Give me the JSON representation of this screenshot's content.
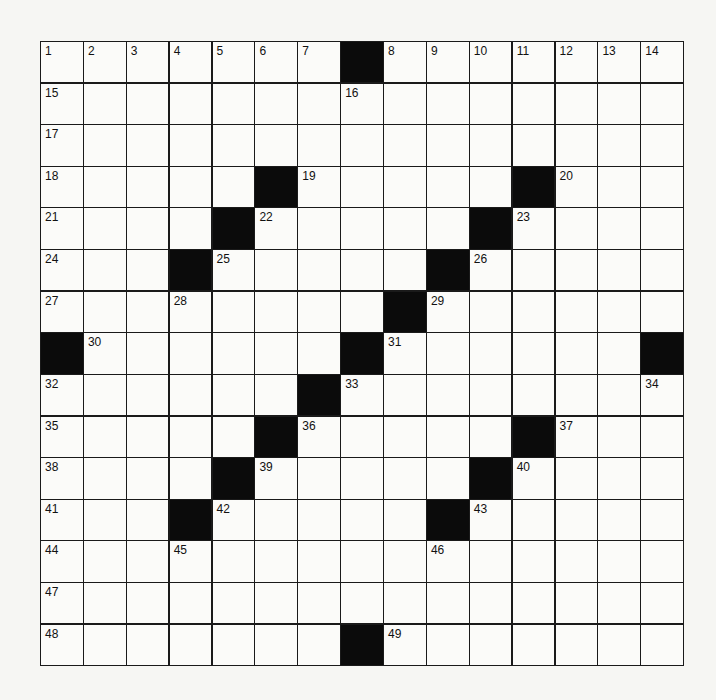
{
  "puzzle": {
    "rows": 15,
    "cols": 15,
    "colors": {
      "block": "#0b0b0b",
      "cell": "#fbfbf9",
      "line": "#1a1a1a"
    },
    "blocks": [
      [
        0,
        7
      ],
      [
        3,
        5
      ],
      [
        3,
        11
      ],
      [
        4,
        4
      ],
      [
        4,
        10
      ],
      [
        5,
        3
      ],
      [
        5,
        9
      ],
      [
        6,
        8
      ],
      [
        7,
        0
      ],
      [
        7,
        7
      ],
      [
        7,
        14
      ],
      [
        8,
        6
      ],
      [
        9,
        5
      ],
      [
        9,
        11
      ],
      [
        10,
        4
      ],
      [
        10,
        10
      ],
      [
        11,
        3
      ],
      [
        11,
        9
      ],
      [
        14,
        7
      ]
    ],
    "numbers": [
      {
        "r": 0,
        "c": 0,
        "n": "1"
      },
      {
        "r": 0,
        "c": 1,
        "n": "2"
      },
      {
        "r": 0,
        "c": 2,
        "n": "3"
      },
      {
        "r": 0,
        "c": 3,
        "n": "4"
      },
      {
        "r": 0,
        "c": 4,
        "n": "5"
      },
      {
        "r": 0,
        "c": 5,
        "n": "6"
      },
      {
        "r": 0,
        "c": 6,
        "n": "7"
      },
      {
        "r": 0,
        "c": 8,
        "n": "8"
      },
      {
        "r": 0,
        "c": 9,
        "n": "9"
      },
      {
        "r": 0,
        "c": 10,
        "n": "10"
      },
      {
        "r": 0,
        "c": 11,
        "n": "11"
      },
      {
        "r": 0,
        "c": 12,
        "n": "12"
      },
      {
        "r": 0,
        "c": 13,
        "n": "13"
      },
      {
        "r": 0,
        "c": 14,
        "n": "14"
      },
      {
        "r": 1,
        "c": 0,
        "n": "15"
      },
      {
        "r": 1,
        "c": 7,
        "n": "16"
      },
      {
        "r": 2,
        "c": 0,
        "n": "17"
      },
      {
        "r": 3,
        "c": 0,
        "n": "18"
      },
      {
        "r": 3,
        "c": 6,
        "n": "19"
      },
      {
        "r": 3,
        "c": 12,
        "n": "20"
      },
      {
        "r": 4,
        "c": 0,
        "n": "21"
      },
      {
        "r": 4,
        "c": 5,
        "n": "22"
      },
      {
        "r": 4,
        "c": 11,
        "n": "23"
      },
      {
        "r": 5,
        "c": 0,
        "n": "24"
      },
      {
        "r": 5,
        "c": 4,
        "n": "25"
      },
      {
        "r": 5,
        "c": 10,
        "n": "26"
      },
      {
        "r": 6,
        "c": 0,
        "n": "27"
      },
      {
        "r": 6,
        "c": 3,
        "n": "28"
      },
      {
        "r": 6,
        "c": 9,
        "n": "29"
      },
      {
        "r": 7,
        "c": 1,
        "n": "30"
      },
      {
        "r": 7,
        "c": 8,
        "n": "31"
      },
      {
        "r": 8,
        "c": 0,
        "n": "32"
      },
      {
        "r": 8,
        "c": 7,
        "n": "33"
      },
      {
        "r": 8,
        "c": 14,
        "n": "34"
      },
      {
        "r": 9,
        "c": 0,
        "n": "35"
      },
      {
        "r": 9,
        "c": 6,
        "n": "36"
      },
      {
        "r": 9,
        "c": 12,
        "n": "37"
      },
      {
        "r": 10,
        "c": 0,
        "n": "38"
      },
      {
        "r": 10,
        "c": 5,
        "n": "39"
      },
      {
        "r": 10,
        "c": 11,
        "n": "40"
      },
      {
        "r": 11,
        "c": 0,
        "n": "41"
      },
      {
        "r": 11,
        "c": 4,
        "n": "42"
      },
      {
        "r": 11,
        "c": 10,
        "n": "43"
      },
      {
        "r": 12,
        "c": 0,
        "n": "44"
      },
      {
        "r": 12,
        "c": 3,
        "n": "45"
      },
      {
        "r": 12,
        "c": 9,
        "n": "46"
      },
      {
        "r": 13,
        "c": 0,
        "n": "47"
      },
      {
        "r": 14,
        "c": 0,
        "n": "48"
      },
      {
        "r": 14,
        "c": 8,
        "n": "49"
      }
    ]
  }
}
